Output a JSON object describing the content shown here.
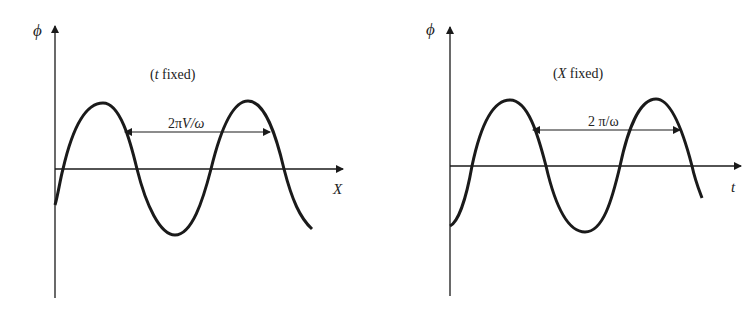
{
  "panels": [
    {
      "id": "left",
      "y_axis_label": "ϕ",
      "x_axis_label": "X",
      "condition": "(t fixed)",
      "condition_var": "t",
      "condition_word": " fixed",
      "period_label": "2πV/ω",
      "period_prefix": "2π",
      "period_var": "V",
      "period_suffix": "/ω"
    },
    {
      "id": "right",
      "y_axis_label": "ϕ",
      "x_axis_label": "t",
      "condition": "(X fixed)",
      "condition_var": "X",
      "condition_word": " fixed",
      "period_label": "2π/ω",
      "period_prefix": "2 π/ω"
    }
  ],
  "colors": {
    "stroke": "#1a1a1a",
    "background": "#ffffff"
  }
}
